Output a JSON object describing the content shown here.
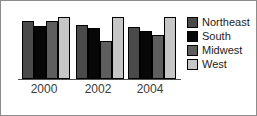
{
  "chart_data": {
    "type": "bar",
    "title": "",
    "xlabel": "",
    "ylabel": "",
    "grid": false,
    "legend_position": "right",
    "categories": [
      "2000",
      "2002",
      "2004"
    ],
    "ylim": [
      0,
      100
    ],
    "series": [
      {
        "name": "Northeast",
        "color": "#4a4a4a",
        "values": [
          87,
          80,
          77
        ]
      },
      {
        "name": "South",
        "color": "#070707",
        "values": [
          79,
          76,
          71
        ]
      },
      {
        "name": "Midwest",
        "color": "#5e5e5e",
        "values": [
          86,
          57,
          65
        ]
      },
      {
        "name": "West",
        "color": "#c6c6c6",
        "values": [
          92,
          92,
          92
        ]
      }
    ]
  },
  "axis": {
    "tick_labels": [
      "2000",
      "2002",
      "2004"
    ]
  },
  "legend": {
    "items": [
      {
        "label": "Northeast",
        "swatch": "northeast-swatch"
      },
      {
        "label": "South",
        "swatch": "south-swatch"
      },
      {
        "label": "Midwest",
        "swatch": "midwest-swatch"
      },
      {
        "label": "West",
        "swatch": "west-swatch"
      }
    ]
  }
}
